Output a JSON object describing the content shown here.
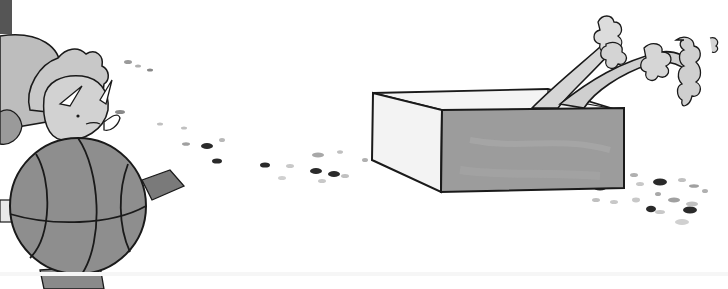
{
  "scene": {
    "description": "Grayscale illustration: dinosaur creature holding a basketball, crumbs trailing to an open cardboard box containing celery",
    "colors": {
      "background": "#ffffff",
      "ink": "#1a1a1a",
      "ball": "#8a8a8a",
      "creature": "#c4c4c4",
      "creature_dark": "#9a9a9a",
      "box_front": "#9c9c9c",
      "box_side": "#f2f2f2",
      "box_inner": "#d8d8d8",
      "celery": "#d2d2d2",
      "crumb_dark": "#2a2a2a",
      "crumb_light": "#b8b8b8"
    },
    "objects": [
      "dinosaur-creature",
      "basketball",
      "cardboard-box",
      "celery-stalks",
      "crumbs"
    ]
  }
}
